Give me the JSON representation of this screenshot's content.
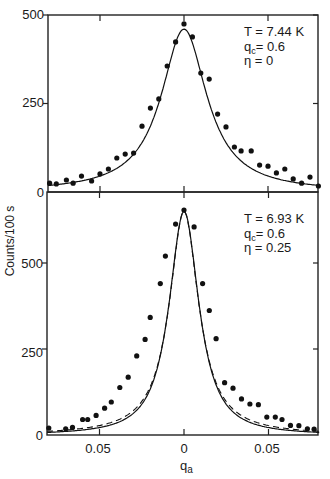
{
  "chart_data": [
    {
      "type": "scatter",
      "panel": "top",
      "title": "",
      "annotation": {
        "T": "T = 7.44 K",
        "qc": "qc= 0.6",
        "eta": "η =0"
      },
      "xlabel": "qa",
      "ylabel": "Counts/100 s",
      "xlim": [
        -0.081,
        0.08
      ],
      "ylim": [
        0,
        500
      ],
      "yticks": [
        0,
        250,
        500
      ],
      "xticks": [
        -0.05,
        0,
        0.05
      ],
      "grid": false,
      "series": [
        {
          "name": "data",
          "style": "points",
          "x": [
            -0.08,
            -0.076,
            -0.07,
            -0.066,
            -0.061,
            -0.055,
            -0.05,
            -0.045,
            -0.04,
            -0.035,
            -0.03,
            -0.025,
            -0.02,
            -0.015,
            -0.01,
            -0.005,
            0.0,
            0.005,
            0.01,
            0.015,
            0.02,
            0.025,
            0.03,
            0.034,
            0.04,
            0.045,
            0.05,
            0.055,
            0.06,
            0.065,
            0.07,
            0.075,
            0.08
          ],
          "y": [
            25,
            23,
            34,
            25,
            45,
            31,
            51,
            65,
            96,
            107,
            110,
            186,
            237,
            263,
            356,
            424,
            475,
            438,
            336,
            319,
            220,
            184,
            127,
            116,
            116,
            76,
            73,
            54,
            65,
            37,
            25,
            42,
            17
          ]
        },
        {
          "name": "fit (η = 0)",
          "style": "solid",
          "model": {
            "amplitude": 460,
            "width": 0.0165,
            "eta": 0,
            "background": 0
          }
        }
      ]
    },
    {
      "type": "scatter",
      "panel": "bottom",
      "title": "",
      "annotation": {
        "T": "T = 6.93K",
        "qc": "qc= 0.6",
        "eta": "η =0.25"
      },
      "xlabel": "qa",
      "ylabel": "Counts/100 s",
      "xlim": [
        -0.081,
        0.08
      ],
      "ylim": [
        0,
        700
      ],
      "yticks": [
        0,
        250,
        500
      ],
      "xticks": [
        -0.05,
        0,
        0.05
      ],
      "xticklabels": [
        "0.05",
        "0",
        "0.05"
      ],
      "grid": false,
      "series": [
        {
          "name": "data",
          "style": "points",
          "x": [
            -0.08,
            -0.07,
            -0.066,
            -0.06,
            -0.057,
            -0.052,
            -0.047,
            -0.043,
            -0.038,
            -0.033,
            -0.028,
            -0.023,
            -0.02,
            -0.014,
            -0.011,
            -0.005,
            0.0,
            0.006,
            0.011,
            0.015,
            0.019,
            0.024,
            0.029,
            0.034,
            0.039,
            0.044,
            0.049,
            0.054,
            0.058,
            0.063,
            0.068,
            0.073,
            0.077
          ],
          "y": [
            20,
            18,
            22,
            45,
            45,
            57,
            78,
            96,
            138,
            168,
            230,
            278,
            342,
            440,
            520,
            613,
            654,
            605,
            440,
            362,
            280,
            152,
            136,
            105,
            90,
            88,
            52,
            52,
            45,
            28,
            27,
            18,
            17
          ]
        },
        {
          "name": "fit (η = 0.25)",
          "style": "solid",
          "model": {
            "amplitude": 650,
            "width": 0.0115,
            "eta": 0.25,
            "background": 0
          }
        },
        {
          "name": "fit (η = 0)",
          "style": "dashed",
          "model": {
            "amplitude": 650,
            "width": 0.0105,
            "eta": 0,
            "background": 0
          }
        }
      ]
    }
  ],
  "figure": {
    "ylabel": "Counts/100 s",
    "xlabel_main": "q",
    "xlabel_sub": "a",
    "top_ticks": {
      "y": [
        "500",
        "250",
        "0"
      ]
    },
    "bottom_ticks": {
      "y": [
        "500",
        "250",
        "0"
      ],
      "x": [
        "0.05",
        "0",
        "0.05"
      ]
    },
    "top_annotation": {
      "line1": "T = 7.44 K",
      "line2_main": "q",
      "line2_sub": "c",
      "line2_rest": "= 0.6",
      "line3": "η = 0"
    },
    "bottom_annotation": {
      "line1": "T = 6.93 K",
      "line2_main": "q",
      "line2_sub": "c",
      "line2_rest": "= 0.6",
      "line3": "η = 0.25"
    }
  }
}
